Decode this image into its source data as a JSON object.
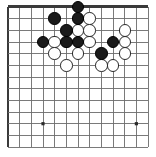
{
  "board": {
    "title": "Go board diagram",
    "game": "Go",
    "type": "go-board-position",
    "visible_columns": 13,
    "visible_rows": 13,
    "grid": {
      "origin_x": 8,
      "origin_y": 7,
      "spacing_x": 11.67,
      "spacing_y": 11.67,
      "line_color": "#6b6b6b",
      "edge_color": "#3a3a3a",
      "background_color": "#ffffff"
    },
    "star_points": [
      {
        "col": 3,
        "row": 3
      },
      {
        "col": 3,
        "row": 10
      },
      {
        "col": 11,
        "row": 10
      }
    ],
    "stone_radius": 6.2,
    "colors": {
      "black_fill": "#1a1a1a",
      "white_fill": "#ffffff",
      "white_outline": "#2b2b2b"
    },
    "stones": [
      {
        "color": "black",
        "col": 6,
        "row": 0,
        "label": "black-stone"
      },
      {
        "color": "black",
        "col": 4,
        "row": 1,
        "label": "black-stone"
      },
      {
        "color": "black",
        "col": 6,
        "row": 1,
        "label": "black-stone"
      },
      {
        "color": "white",
        "col": 7,
        "row": 1,
        "label": "white-stone"
      },
      {
        "color": "black",
        "col": 5,
        "row": 2,
        "label": "black-stone"
      },
      {
        "color": "white",
        "col": 6,
        "row": 2,
        "label": "white-stone"
      },
      {
        "color": "white",
        "col": 7,
        "row": 2,
        "label": "white-stone"
      },
      {
        "color": "white",
        "col": 10,
        "row": 2,
        "label": "white-stone"
      },
      {
        "color": "black",
        "col": 3,
        "row": 3,
        "label": "black-stone"
      },
      {
        "color": "white",
        "col": 4,
        "row": 3,
        "label": "white-stone"
      },
      {
        "color": "black",
        "col": 5,
        "row": 3,
        "label": "black-stone"
      },
      {
        "color": "black",
        "col": 6,
        "row": 3,
        "label": "black-stone"
      },
      {
        "color": "white",
        "col": 7,
        "row": 3,
        "label": "white-stone"
      },
      {
        "color": "black",
        "col": 9,
        "row": 3,
        "label": "black-stone"
      },
      {
        "color": "white",
        "col": 10,
        "row": 3,
        "label": "white-stone"
      },
      {
        "color": "white",
        "col": 4,
        "row": 4,
        "label": "white-stone"
      },
      {
        "color": "white",
        "col": 6,
        "row": 4,
        "label": "white-stone"
      },
      {
        "color": "black",
        "col": 8,
        "row": 4,
        "label": "black-stone"
      },
      {
        "color": "white",
        "col": 10,
        "row": 4,
        "label": "white-stone"
      },
      {
        "color": "white",
        "col": 5,
        "row": 5,
        "label": "white-stone"
      },
      {
        "color": "white",
        "col": 8,
        "row": 5,
        "label": "white-stone"
      },
      {
        "color": "white",
        "col": 9,
        "row": 5,
        "label": "white-stone"
      }
    ],
    "counts": {
      "black_stones": 9,
      "white_stones": 13,
      "total_stones": 22
    }
  }
}
